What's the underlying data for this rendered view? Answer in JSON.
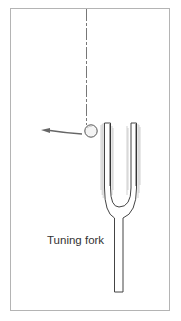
{
  "figure": {
    "label": "Tuning fork",
    "colors": {
      "frame": "#b4b4b4",
      "outline": "#444444",
      "vibration_shading": "#9a9a9a",
      "string": "#777777",
      "ball_fill": "#f2f2f2",
      "arrow": "#666666"
    },
    "parts": [
      "suspended-string",
      "pendulum-ball",
      "motion-arrow",
      "tuning-fork"
    ]
  }
}
